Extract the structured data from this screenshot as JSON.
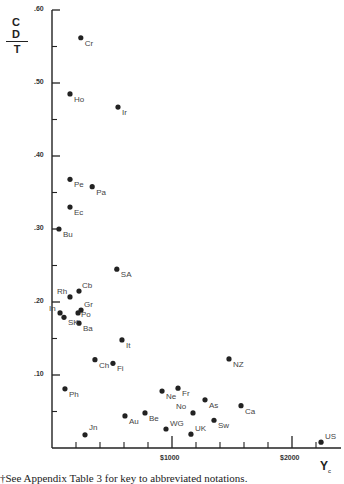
{
  "chart_data": {
    "type": "scatter",
    "title": "",
    "ylabel": "CD / T",
    "ylabel_numerator": "C D",
    "ylabel_denominator": "T",
    "xlabel": "Y",
    "xlabel_subscript": "c",
    "xlim": [
      0,
      2400
    ],
    "ylim": [
      0,
      0.6
    ],
    "grid": false,
    "legend": null,
    "x_ticks": [
      {
        "value": 1000,
        "label": "$1000"
      },
      {
        "value": 2000,
        "label": "$2000"
      }
    ],
    "x_minor_ticks": [
      200,
      400,
      600,
      800,
      1200,
      1400,
      1600,
      1800,
      2200
    ],
    "y_ticks": [
      {
        "value": 0.1,
        "label": ".10"
      },
      {
        "value": 0.2,
        "label": ".20"
      },
      {
        "value": 0.3,
        "label": ".30"
      },
      {
        "value": 0.4,
        "label": ".40"
      },
      {
        "value": 0.5,
        "label": ".50"
      },
      {
        "value": 0.6,
        "label": ".60"
      }
    ],
    "y_minor_ticks": [
      0.05,
      0.15,
      0.25,
      0.35,
      0.45,
      0.55
    ],
    "points": [
      {
        "label": "Cr",
        "x": 240,
        "y": 0.562
      },
      {
        "label": "Ho",
        "x": 150,
        "y": 0.485
      },
      {
        "label": "Ir",
        "x": 550,
        "y": 0.467
      },
      {
        "label": "Pe",
        "x": 150,
        "y": 0.368
      },
      {
        "label": "Pa",
        "x": 335,
        "y": 0.358
      },
      {
        "label": "Ec",
        "x": 150,
        "y": 0.33
      },
      {
        "label": "Bu",
        "x": 58,
        "y": 0.3
      },
      {
        "label": "SA",
        "x": 540,
        "y": 0.245
      },
      {
        "label": "Cb",
        "x": 225,
        "y": 0.215
      },
      {
        "label": "Rh",
        "x": 150,
        "y": 0.207
      },
      {
        "label": "Gr",
        "x": 242,
        "y": 0.189
      },
      {
        "label": "Po",
        "x": 217,
        "y": 0.185
      },
      {
        "label": "In",
        "x": 67,
        "y": 0.185
      },
      {
        "label": "SK",
        "x": 100,
        "y": 0.179
      },
      {
        "label": "Ba",
        "x": 225,
        "y": 0.171
      },
      {
        "label": "It",
        "x": 583,
        "y": 0.148
      },
      {
        "label": "Ch",
        "x": 358,
        "y": 0.121
      },
      {
        "label": "Fi",
        "x": 508,
        "y": 0.116
      },
      {
        "label": "Ph",
        "x": 108,
        "y": 0.081
      },
      {
        "label": "NZ",
        "x": 1475,
        "y": 0.122
      },
      {
        "label": "Ne",
        "x": 917,
        "y": 0.078
      },
      {
        "label": "Fr",
        "x": 1050,
        "y": 0.082
      },
      {
        "label": "As",
        "x": 1275,
        "y": 0.066
      },
      {
        "label": "Ca",
        "x": 1575,
        "y": 0.058
      },
      {
        "label": "No",
        "x": 1175,
        "y": 0.048
      },
      {
        "label": "Au",
        "x": 608,
        "y": 0.044
      },
      {
        "label": "Be",
        "x": 775,
        "y": 0.048
      },
      {
        "label": "Sw",
        "x": 1350,
        "y": 0.038
      },
      {
        "label": "WG",
        "x": 950,
        "y": 0.026
      },
      {
        "label": "UK",
        "x": 1158,
        "y": 0.019
      },
      {
        "label": "Jn",
        "x": 275,
        "y": 0.018
      },
      {
        "label": "US",
        "x": 2242,
        "y": 0.008
      }
    ]
  },
  "labels": {
    "ylabel_num": "C D",
    "ylabel_den": "T",
    "xlabel_main": "Y",
    "xlabel_sub": "c",
    "caption": "†See Appendix Table 3 for key to abbreviated notations."
  },
  "colors": {
    "ink": "#222222",
    "label": "#444444",
    "background": "#ffffff"
  }
}
